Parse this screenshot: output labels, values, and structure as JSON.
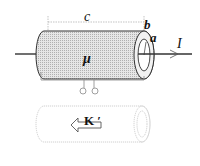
{
  "figure": {
    "labels": {
      "length": "c",
      "outer_radius": "b",
      "inner_radius": "a",
      "current": "I",
      "permeability": "μ",
      "surface_current": "K ′"
    },
    "colors": {
      "stroke": "#333333",
      "fill_shell": "#d8d8d8",
      "faded_stroke": "#bbbbbb"
    }
  }
}
